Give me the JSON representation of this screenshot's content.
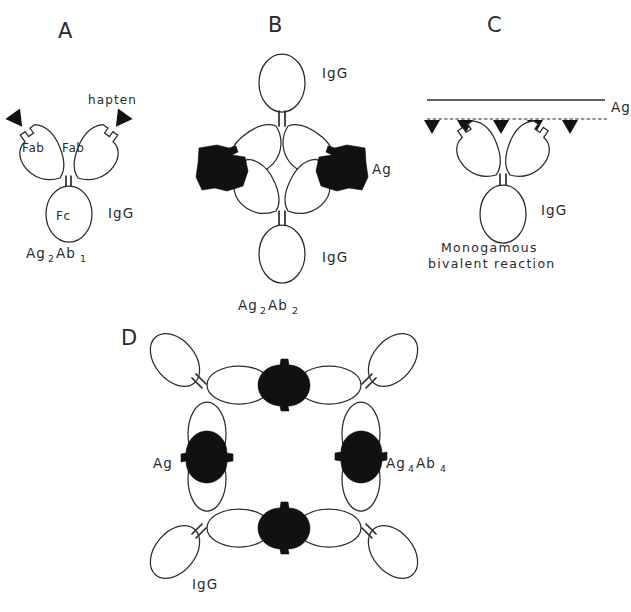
{
  "figure": {
    "background": "#ffffff",
    "ink": "#2b2b2b",
    "antigen_fill": "#111111",
    "antibody_fill": "#ffffff",
    "title": "",
    "panels": [
      {
        "id": "A",
        "letter": "A",
        "letter_x": 58,
        "letter_y": 38,
        "labels": {
          "hapten": "hapten",
          "fab_left": "Fab",
          "fab_right": "Fab",
          "fc": "Fc",
          "igg": "IgG",
          "formula": "Ag",
          "formula_sub1": "2",
          "formula_mid": "Ab",
          "formula_sub2": "1"
        },
        "description": "Single IgG antibody with two Fab arms bearing haptens and an Fc stem",
        "antigen_count": 0,
        "antibody_count": 1,
        "hapten_count": 2
      },
      {
        "id": "B",
        "letter": "B",
        "letter_x": 268,
        "letter_y": 32,
        "labels": {
          "igg_top": "IgG",
          "igg_bottom": "IgG",
          "ag": "Ag",
          "formula": "Ag",
          "formula_sub1": "2",
          "formula_mid": "Ab",
          "formula_sub2": "2"
        },
        "description": "Two IgG molecules cross-linked by two antigens forming a closed ring dimer",
        "antigen_count": 2,
        "antibody_count": 2
      },
      {
        "id": "C",
        "letter": "C",
        "letter_x": 487,
        "letter_y": 32,
        "labels": {
          "ag": "Ag",
          "igg": "IgG",
          "caption_line1": "Monogamous",
          "caption_line2": "bivalent  reaction"
        },
        "description": "One IgG binding with both Fab arms to two epitopes on the same antigen surface",
        "epitope_count": 5,
        "antibody_count": 1
      },
      {
        "id": "D",
        "letter": "D",
        "letter_x": 121,
        "letter_y": 345,
        "labels": {
          "ag": "Ag",
          "igg": "IgG",
          "formula": "Ag",
          "formula_sub1": "4",
          "formula_mid": "Ab",
          "formula_sub2": "4"
        },
        "description": "Square lattice of four IgG molecules cross-linked by four antigens",
        "antigen_count": 4,
        "antibody_count": 4
      }
    ]
  }
}
